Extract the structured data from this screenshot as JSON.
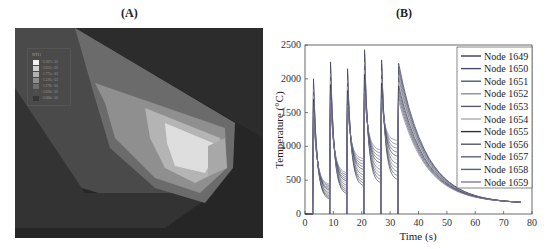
{
  "panels": {
    "a": {
      "label": "(A)"
    },
    "b": {
      "label": "(B)"
    }
  },
  "fe_legend": {
    "title": "NT11",
    "values": [
      "+2.287e+03",
      "+2.052e+03",
      "+1.775e+03",
      "+1.526e+03",
      "+1.278e+03",
      "+1.030e+03",
      "+2.000e+02"
    ],
    "swatches": [
      "#f2f2f2",
      "#d0d0d0",
      "#b0b0b0",
      "#8e8e8e",
      "#6e6e6e",
      "#4e4e4e",
      "#363636"
    ]
  },
  "chart_data": {
    "type": "line",
    "title": "",
    "xlabel": "Time (s)",
    "ylabel": "Temperature (°C)",
    "xlim": [
      0,
      80
    ],
    "ylim": [
      0,
      2500
    ],
    "xticks": [
      0,
      10,
      20,
      30,
      40,
      50,
      60,
      70,
      80
    ],
    "yticks": [
      0,
      500,
      1000,
      1500,
      2000,
      2500
    ],
    "grid": false,
    "legend_position": "upper right",
    "series": [
      {
        "name": "Node 1649",
        "color": "#3a3a5a"
      },
      {
        "name": "Node 1650",
        "color": "#4a4a6a"
      },
      {
        "name": "Node 1651",
        "color": "#505a6a"
      },
      {
        "name": "Node 1652",
        "color": "#8a8a9a"
      },
      {
        "name": "Node 1653",
        "color": "#5a5a70"
      },
      {
        "name": "Node 1654",
        "color": "#a8a8b0"
      },
      {
        "name": "Node 1655",
        "color": "#2f2f45"
      },
      {
        "name": "Node 1656",
        "color": "#55556a"
      },
      {
        "name": "Node 1657",
        "color": "#606075"
      },
      {
        "name": "Node 1658",
        "color": "#55657a"
      },
      {
        "name": "Node 1659",
        "color": "#8a7aa0"
      }
    ],
    "approx_peaks": [
      {
        "t": 3,
        "T": 2000
      },
      {
        "t": 9,
        "T": 2250
      },
      {
        "t": 15,
        "T": 2150
      },
      {
        "t": 21,
        "T": 2430
      },
      {
        "t": 27,
        "T": 2280
      },
      {
        "t": 33,
        "T": 2230
      }
    ],
    "approx_troughs_min_series": [
      {
        "t": 9,
        "T": 200
      },
      {
        "t": 15,
        "T": 280
      },
      {
        "t": 21,
        "T": 400
      },
      {
        "t": 27,
        "T": 440
      },
      {
        "t": 33,
        "T": 490
      }
    ],
    "end_value": {
      "t": 76,
      "T": 150
    }
  }
}
